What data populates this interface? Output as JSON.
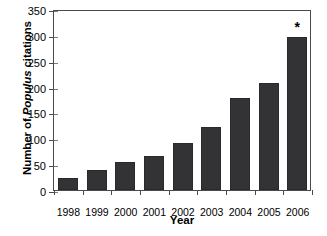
{
  "chart_data": {
    "type": "bar",
    "title": "",
    "xlabel": "Year",
    "ylabel": "Number of Populus citations",
    "ylabel_parts": {
      "prefix": "Number of ",
      "italic": "Populus",
      "suffix": " citations"
    },
    "categories": [
      "1998",
      "1999",
      "2000",
      "2001",
      "2002",
      "2003",
      "2004",
      "2005",
      "2006"
    ],
    "values": [
      23,
      38,
      54,
      65,
      91,
      122,
      177,
      207,
      296
    ],
    "ylim": [
      0,
      350
    ],
    "yticks": [
      0,
      50,
      100,
      150,
      200,
      250,
      300,
      350
    ],
    "ytick_labels": [
      "0",
      "50",
      "100",
      "150",
      "200",
      "250",
      "300",
      "350"
    ],
    "grid": false,
    "legend": null,
    "bar_color": "#333335",
    "axis_color": "#4a4a4a",
    "background": "#ffffff",
    "annotations": [
      {
        "category": "2006",
        "text": "*",
        "position": "above-bar"
      }
    ]
  }
}
